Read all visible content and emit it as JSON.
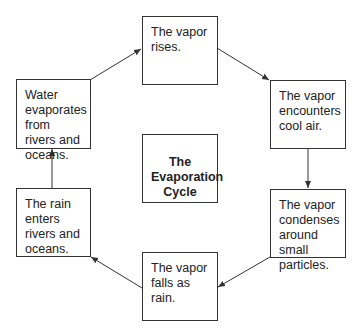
{
  "title": "The Evaporation Cycle",
  "center": {
    "line1": "The",
    "line2": "Evaporation",
    "line3": "Cycle"
  },
  "steps": [
    {
      "id": "water-evaporates",
      "text": "Water evaporates from rivers and oceans."
    },
    {
      "id": "vapor-rises",
      "text": "The vapor rises."
    },
    {
      "id": "vapor-encounters",
      "text": "The vapor encounters cool air."
    },
    {
      "id": "vapor-condenses",
      "text": "The vapor condenses around small particles."
    },
    {
      "id": "vapor-falls",
      "text": "The vapor falls as rain."
    },
    {
      "id": "rain-enters",
      "text": "The rain enters rivers and oceans."
    }
  ],
  "colors": {
    "line": "#333333",
    "text": "#222222",
    "background": "#ffffff"
  }
}
